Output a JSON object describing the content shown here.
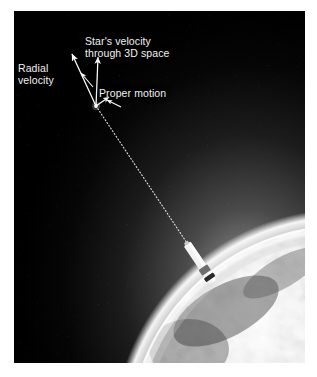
{
  "figure": {
    "background_color": "#ffffff",
    "plate": {
      "background_color": "#000000",
      "border_color": "#d8d8d8"
    }
  },
  "labels": {
    "star_velocity": "Star's velocity\nthrough 3D space",
    "radial_velocity": "Radial\nvelocity",
    "proper_motion": "Proper motion"
  },
  "colors": {
    "label_text": "#f2f2f2",
    "vector_arrow": "#ffffff",
    "sightline": "#e8e8e8",
    "space_black": "#000000",
    "earth_limb_glow": "#f2f2f2",
    "earth_surface": "#8a8a8a",
    "spacecraft_body": "#f0f0f0"
  },
  "scene": {
    "star_point": {
      "x": 82,
      "y": 95
    },
    "vectors": [
      {
        "name": "star-velocity-vector",
        "from_x": 82,
        "from_y": 95,
        "to_x": 84,
        "to_y": 44
      },
      {
        "name": "radial-velocity-vector",
        "from_x": 82,
        "from_y": 95,
        "to_x": 57,
        "to_y": 41
      },
      {
        "name": "proper-motion-vector",
        "from_x": 82,
        "from_y": 95,
        "to_x": 95,
        "to_y": 85
      }
    ],
    "leader_lines": [
      {
        "name": "radial-velocity-leader",
        "from_x": 78,
        "from_y": 74,
        "to_x": 66,
        "to_y": 61
      },
      {
        "name": "proper-motion-leader",
        "from_x": 106,
        "from_y": 95,
        "to_x": 92,
        "to_y": 88
      }
    ],
    "sightline": {
      "from_x": 82,
      "from_y": 95,
      "to_x": 185,
      "to_y": 250
    },
    "spacecraft": {
      "x": 186,
      "y": 252,
      "length": 46,
      "angle_deg": 56
    },
    "earth": {
      "center_x": 330,
      "center_y": 430,
      "radius": 215
    }
  }
}
